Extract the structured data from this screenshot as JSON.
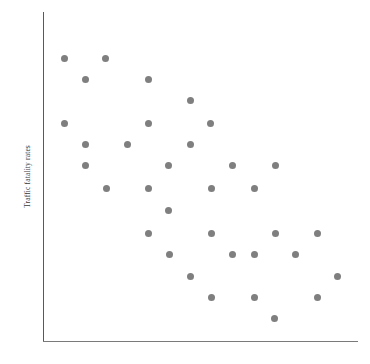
{
  "chart_data": {
    "type": "scatter",
    "title": "",
    "subtitle": "",
    "xlabel": "",
    "ylabel": "Traffic fatality rates",
    "xlim": [
      0,
      315
    ],
    "ylim": [
      0,
      329
    ],
    "grid": false,
    "legend": null,
    "legend_position": "none",
    "x_tick_labels": [],
    "y_tick_labels": [],
    "annotations": [],
    "marker": {
      "shape": "circle",
      "color": "#7f7f7f",
      "size_px": 7
    },
    "axis_color": "#595959",
    "background_color": "#ffffff",
    "relationship": "negative",
    "n_points": 36,
    "points": [
      {
        "x": 21,
        "y": 283
      },
      {
        "x": 62,
        "y": 283
      },
      {
        "x": 42,
        "y": 262
      },
      {
        "x": 105,
        "y": 262
      },
      {
        "x": 147,
        "y": 241
      },
      {
        "x": 21,
        "y": 218
      },
      {
        "x": 105,
        "y": 218
      },
      {
        "x": 167,
        "y": 218
      },
      {
        "x": 42,
        "y": 197
      },
      {
        "x": 84,
        "y": 197
      },
      {
        "x": 147,
        "y": 197
      },
      {
        "x": 42,
        "y": 176
      },
      {
        "x": 125,
        "y": 176
      },
      {
        "x": 189,
        "y": 176
      },
      {
        "x": 232,
        "y": 176
      },
      {
        "x": 63,
        "y": 153
      },
      {
        "x": 105,
        "y": 153
      },
      {
        "x": 168,
        "y": 153
      },
      {
        "x": 211,
        "y": 153
      },
      {
        "x": 125,
        "y": 131
      },
      {
        "x": 105,
        "y": 108
      },
      {
        "x": 168,
        "y": 108
      },
      {
        "x": 232,
        "y": 108
      },
      {
        "x": 274,
        "y": 108
      },
      {
        "x": 126,
        "y": 87
      },
      {
        "x": 189,
        "y": 87
      },
      {
        "x": 211,
        "y": 87
      },
      {
        "x": 252,
        "y": 87
      },
      {
        "x": 147,
        "y": 65
      },
      {
        "x": 294,
        "y": 65
      },
      {
        "x": 168,
        "y": 44
      },
      {
        "x": 211,
        "y": 44
      },
      {
        "x": 274,
        "y": 44
      },
      {
        "x": 231,
        "y": 23
      }
    ]
  },
  "axis": {
    "y_title": "Traffic fatality rates",
    "x_title": ""
  }
}
